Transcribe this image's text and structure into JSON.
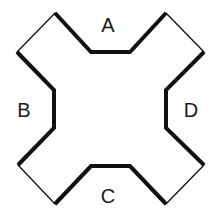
{
  "diagram": {
    "type": "cross-shaped polygon with labeled thick edges",
    "colors": {
      "stroke": "#111111",
      "background": "#ffffff",
      "label": "#1a1a1a"
    },
    "labels": {
      "top": "A",
      "left": "B",
      "bottom": "C",
      "right": "D"
    },
    "label_positions": {
      "A": [
        108,
        25
      ],
      "B": [
        24,
        110
      ],
      "C": [
        108,
        196
      ],
      "D": [
        190,
        110
      ]
    },
    "vertices": [
      [
        55,
        13
      ],
      [
        91,
        52
      ],
      [
        130,
        52
      ],
      [
        166,
        13
      ],
      [
        204,
        52
      ],
      [
        166,
        90
      ],
      [
        166,
        128
      ],
      [
        204,
        165
      ],
      [
        166,
        204
      ],
      [
        130,
        166
      ],
      [
        91,
        166
      ],
      [
        55,
        204
      ],
      [
        18,
        165
      ],
      [
        54,
        128
      ],
      [
        54,
        90
      ],
      [
        17,
        52
      ]
    ],
    "thick_segments": {
      "A": "55,13 91,52 130,52 166,13",
      "D": "204,52 166,90 166,128 204,165",
      "C": "166,204 130,166 91,166 55,204",
      "B": "18,165 54,128 54,90 17,52"
    },
    "thin_segments": {
      "top_right_corner": "166,13 204,52",
      "bottom_right_corner": "204,165 166,204",
      "bottom_left_corner": "55,204 18,165",
      "top_left_corner": "17,52 55,13"
    }
  }
}
